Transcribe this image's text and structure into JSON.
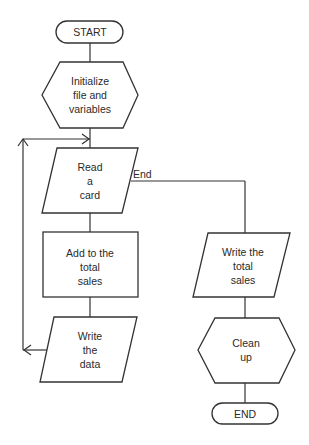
{
  "diagram": {
    "type": "flowchart",
    "nodes": {
      "start": {
        "shape": "terminal",
        "lines": [
          "START"
        ]
      },
      "init": {
        "shape": "preparation",
        "lines": [
          "Initialize",
          "file and",
          "variables"
        ]
      },
      "read": {
        "shape": "input-output",
        "lines": [
          "Read",
          "a",
          "card"
        ]
      },
      "add": {
        "shape": "process",
        "lines": [
          "Add to the",
          "total",
          "sales"
        ]
      },
      "write_data": {
        "shape": "input-output",
        "lines": [
          "Write",
          "the",
          "data"
        ]
      },
      "write_total": {
        "shape": "input-output",
        "lines": [
          "Write the",
          "total",
          "sales"
        ]
      },
      "cleanup": {
        "shape": "preparation",
        "lines": [
          "Clean",
          "up"
        ]
      },
      "end": {
        "shape": "terminal",
        "lines": [
          "END"
        ]
      }
    },
    "edges": {
      "read_to_write_total": {
        "label": "End"
      }
    },
    "colors": {
      "stroke": "#333333",
      "text": "#2a2a2a",
      "background": "#ffffff"
    }
  }
}
